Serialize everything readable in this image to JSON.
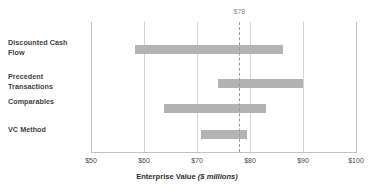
{
  "chart_data": {
    "type": "bar",
    "chart_style": "football-field-range-bars",
    "title": "",
    "xlabel": "Enterprise Value ($ millions)",
    "xlabel_main": "Enterprise Value",
    "xlabel_unit": "($ millions)",
    "ylabel": "",
    "xlim": [
      50,
      100
    ],
    "xticks": [
      50,
      60,
      70,
      80,
      90,
      100
    ],
    "xtick_labels": [
      "$50",
      "$60",
      "$70",
      "$80",
      "$90",
      "$100"
    ],
    "grid": "vertical",
    "legend": "none",
    "categories": [
      "Discounted Cash Flow",
      "Precedent Transactions",
      "Comparables",
      "VC Method"
    ],
    "ranges": [
      {
        "name": "Discounted Cash Flow",
        "low": 58.3,
        "high": 86.2
      },
      {
        "name": "Precedent Transactions",
        "low": 74.0,
        "high": 90.0
      },
      {
        "name": "Comparables",
        "low": 63.8,
        "high": 83.0
      },
      {
        "name": "VC Method",
        "low": 70.8,
        "high": 79.4
      }
    ],
    "annotations": [
      {
        "type": "vertical-reference-line",
        "value": 78,
        "label": "$78",
        "style": "dashed"
      }
    ],
    "bar_color": "#b3b3b3",
    "gridline_color": "#d4d4d4",
    "reference_line_color": "#9a9a9a"
  },
  "labels": {
    "cat0_line1": "Discounted Cash",
    "cat0_line2": "Flow",
    "cat1_line1": "Precedent",
    "cat1_line2": "Transactions",
    "cat2_line1": "Comparables",
    "cat3_line1": "VC Method"
  },
  "ticks": {
    "t0": "$50",
    "t1": "$60",
    "t2": "$70",
    "t3": "$80",
    "t4": "$90",
    "t5": "$100"
  },
  "reference": {
    "label": "$78"
  },
  "axis": {
    "title_main": "Enterprise Value",
    "title_unit": "($ millions)"
  }
}
